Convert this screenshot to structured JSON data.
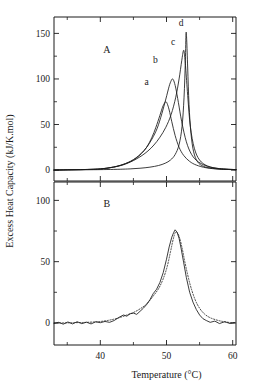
{
  "figure": {
    "name": "excess-heat-capacity-vs-temperature",
    "background_color": "#ffffff",
    "line_color": "#1a1a1a",
    "axis_color": "#1a1a1a"
  },
  "axes": {
    "x": {
      "label": "Temperature (°C)",
      "ticks": [
        "40",
        "50",
        "60"
      ],
      "tick_values": [
        40,
        50,
        60
      ],
      "minor_tick_values": [
        35,
        45,
        55
      ],
      "range": [
        33,
        60.5
      ]
    },
    "y_panel_a": {
      "ticks": [
        "0",
        "50",
        "100",
        "150"
      ],
      "tick_values": [
        0,
        50,
        100,
        150
      ],
      "minor_tick_values": [
        25,
        75,
        125
      ],
      "range": [
        -12,
        168
      ]
    },
    "y_panel_b": {
      "ticks": [
        "0",
        "50",
        "100"
      ],
      "tick_values": [
        0,
        50,
        100
      ],
      "minor_tick_values": [
        25,
        75
      ],
      "range": [
        -18,
        115
      ]
    },
    "y_label": "Excess Heat Capacity (kJ/K.mol)"
  },
  "panels": [
    {
      "id": "A",
      "label": "A",
      "label_x": 41,
      "label_y": 128
    },
    {
      "id": "B",
      "label": "B",
      "label_x": 41,
      "label_y": 95
    }
  ],
  "curve_labels": [
    {
      "text": "a",
      "x": 47.0,
      "y": 93
    },
    {
      "text": "b",
      "x": 48.3,
      "y": 117
    },
    {
      "text": "c",
      "x": 51.0,
      "y": 137
    },
    {
      "text": "d",
      "x": 52.2,
      "y": 158
    }
  ],
  "chart_data": {
    "type": "line",
    "title": "",
    "xlabel": "Temperature (°C)",
    "ylabel": "Excess Heat Capacity (kJ/K.mol)",
    "xlim": [
      33,
      60.5
    ],
    "grid": false,
    "legend": "inline-curve-labels",
    "panels": [
      {
        "panel": "A",
        "ylim": [
          -12,
          168
        ],
        "yticks": [
          0,
          50,
          100,
          150
        ],
        "annotation": "A",
        "series": [
          {
            "name": "a",
            "style": "solid",
            "peak_temperature": 49.9,
            "peak_value": 75,
            "x": [
              33,
              35,
              37,
              39,
              40,
              41,
              42,
              43,
              43.8,
              44.6,
              45.4,
              46.2,
              47.0,
              47.8,
              48.4,
              49.0,
              49.4,
              49.7,
              49.9,
              50.1,
              50.4,
              50.8,
              51.3,
              51.9,
              52.6,
              53.5,
              54.5,
              56.0,
              58.0,
              60.5
            ],
            "y": [
              0,
              0.3,
              0.5,
              0.8,
              1.2,
              2.0,
              3.2,
              5.0,
              7.0,
              9.5,
              13.0,
              18.0,
              25.0,
              36.0,
              47.0,
              60.0,
              69.0,
              73.5,
              75.0,
              73.0,
              66.0,
              53.0,
              38.0,
              25.0,
              16.0,
              9.5,
              5.5,
              2.5,
              1.0,
              0.4
            ]
          },
          {
            "name": "b",
            "style": "solid",
            "peak_temperature": 50.9,
            "peak_value": 100,
            "x": [
              33,
              35,
              37,
              39,
              40,
              41,
              42,
              43,
              43.8,
              44.6,
              45.4,
              46.2,
              47.0,
              47.8,
              48.6,
              49.3,
              49.9,
              50.4,
              50.7,
              50.9,
              51.1,
              51.4,
              51.8,
              52.3,
              53.0,
              53.8,
              54.8,
              56.2,
              58.0,
              60.5
            ],
            "y": [
              0,
              0.3,
              0.5,
              0.9,
              1.3,
              2.1,
              3.4,
              5.2,
              7.2,
              9.8,
              13.5,
              18.5,
              25.0,
              34.0,
              46.0,
              62.0,
              78.0,
              92.0,
              98.0,
              100.0,
              98.0,
              90.0,
              74.0,
              53.0,
              31.0,
              17.0,
              9.0,
              4.0,
              1.5,
              0.5
            ]
          },
          {
            "name": "c",
            "style": "solid",
            "peak_temperature": 52.6,
            "peak_value": 131,
            "x": [
              33,
              35,
              37,
              39,
              40,
              41,
              42,
              43,
              43.8,
              44.6,
              45.4,
              46.3,
              47.2,
              48.1,
              49.0,
              49.9,
              50.7,
              51.4,
              51.9,
              52.3,
              52.55,
              52.7,
              52.9,
              53.2,
              53.6,
              54.2,
              55.0,
              56.2,
              58.0,
              60.5
            ],
            "y": [
              0,
              0.3,
              0.5,
              0.9,
              1.3,
              2.0,
              3.2,
              4.8,
              6.6,
              9.0,
              12.0,
              16.0,
              21.0,
              27.5,
              36.0,
              47.0,
              61.0,
              80.0,
              100.0,
              120.0,
              131.0,
              128.0,
              112.0,
              82.0,
              48.0,
              24.0,
              11.0,
              4.5,
              1.6,
              0.5
            ]
          },
          {
            "name": "d",
            "style": "solid",
            "peak_temperature": 52.95,
            "peak_value": 150,
            "x": [
              33,
              36,
              39,
              41,
              43,
              44.5,
              46,
              47.5,
              48.8,
              49.8,
              50.6,
              51.3,
              51.9,
              52.35,
              52.65,
              52.85,
              52.95,
              53.05,
              53.2,
              53.4,
              53.7,
              54.1,
              54.7,
              55.6,
              57.0,
              58.6,
              60.5
            ],
            "y": [
              0,
              0.2,
              0.4,
              0.6,
              0.9,
              1.3,
              2.0,
              3.2,
              5.0,
              7.5,
              11.0,
              17.0,
              28.0,
              48.0,
              80.0,
              120.0,
              150.0,
              143.0,
              112.0,
              72.0,
              40.0,
              20.0,
              9.0,
              4.0,
              1.8,
              0.9,
              0.4
            ]
          }
        ]
      },
      {
        "panel": "B",
        "ylim": [
          -18,
          115
        ],
        "yticks": [
          0,
          50,
          100
        ],
        "annotation": "B",
        "series": [
          {
            "name": "experimental",
            "style": "solid",
            "peak_temperature": 51.3,
            "peak_value": 76,
            "x": [
              33,
              33.7,
              34.4,
              35.1,
              35.8,
              36.5,
              37.2,
              37.9,
              38.6,
              39.3,
              40,
              40.7,
              41.4,
              42.1,
              42.8,
              43.5,
              44,
              44.5,
              45,
              45.5,
              46,
              46.5,
              47,
              47.5,
              48,
              48.5,
              49,
              49.5,
              50,
              50.4,
              50.8,
              51.1,
              51.3,
              51.6,
              51.9,
              52.2,
              52.6,
              53,
              53.5,
              54,
              54.5,
              55,
              55.5,
              56,
              56.6,
              57.3,
              58,
              58.8,
              59.6,
              60.3
            ],
            "y": [
              -0.5,
              0.5,
              -1,
              0.8,
              -0.8,
              1,
              -0.6,
              0.6,
              -0.8,
              0.9,
              0.2,
              1.2,
              0.5,
              2.0,
              4.5,
              6.5,
              5.5,
              7.5,
              8.0,
              7.0,
              9.5,
              12.0,
              15.0,
              19.0,
              24.0,
              27.5,
              33.0,
              41.0,
              52.0,
              62.0,
              70.0,
              74.0,
              76.0,
              74.0,
              69.0,
              61.0,
              49.0,
              37.0,
              25.0,
              17.0,
              11.0,
              6.5,
              3.5,
              2.0,
              0.5,
              1.5,
              -0.5,
              1.0,
              -0.5,
              0.2
            ]
          },
          {
            "name": "fit",
            "style": "dotted",
            "peak_temperature": 51.35,
            "peak_value": 74,
            "x": [
              33,
              34.5,
              36,
              37.5,
              39,
              40.5,
              42,
              43,
              44,
              45,
              46,
              47,
              48,
              48.8,
              49.5,
              50.1,
              50.6,
              51,
              51.35,
              51.7,
              52,
              52.4,
              52.8,
              53.3,
              53.8,
              54.4,
              55,
              55.7,
              56.5,
              57.5,
              58.5,
              59.5,
              60.3
            ],
            "y": [
              0,
              0,
              0.2,
              0.4,
              0.8,
              1.5,
              3.0,
              4.5,
              6.5,
              8.5,
              11.5,
              15.5,
              22.0,
              28.0,
              36.0,
              46.0,
              58.0,
              68.0,
              74.0,
              73.0,
              69.0,
              60.0,
              49.0,
              37.0,
              27.0,
              18.0,
              12.0,
              7.5,
              4.5,
              2.5,
              1.2,
              0.4,
              0.2
            ]
          }
        ]
      }
    ]
  }
}
